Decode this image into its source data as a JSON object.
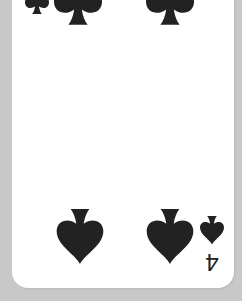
{
  "card": {
    "rank": "4",
    "suit": "spades",
    "suit_icon": "spade-icon",
    "ink_color": "#222222",
    "face_color": "#ffffff",
    "table_color": "#c8c8c8",
    "orientation_note": "bottom corner index shown rotated 180 degrees"
  },
  "corner_index_bottom": {
    "rank": "4",
    "suit_icon": "spade-icon"
  },
  "pips": [
    {
      "position": "top-left",
      "icon": "spade-icon"
    },
    {
      "position": "top-right",
      "icon": "spade-icon"
    },
    {
      "position": "bottom-left",
      "icon": "spade-icon"
    },
    {
      "position": "bottom-right",
      "icon": "spade-icon"
    }
  ]
}
